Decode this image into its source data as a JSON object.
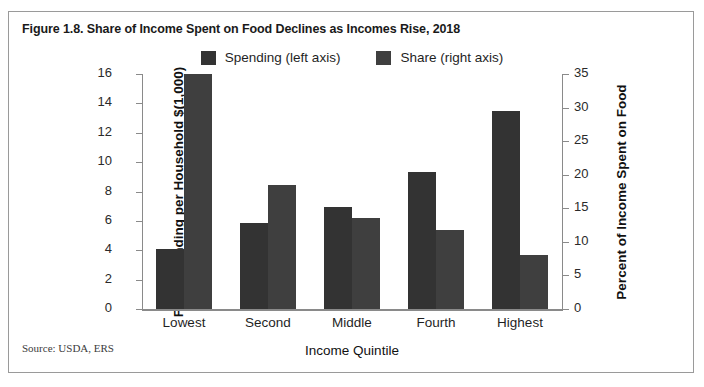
{
  "figure": {
    "title": "Figure 1.8. Share of Income Spent on Food Declines as Incomes Rise, 2018",
    "source": "Source: USDA, ERS"
  },
  "colors": {
    "spending_bar": "#333333",
    "share_bar": "#3f3f3f",
    "axis": "#8a8a8a",
    "text": "#1f1f1f",
    "card_border": "#9a9a9a"
  },
  "chart_data": {
    "type": "bar",
    "title": "Figure 1.8. Share of Income Spent on Food Declines as Incomes Rise, 2018",
    "xlabel": "Income Quintile",
    "ylabel": "Food Spending per Household $(1,000)",
    "ylabel_secondary": "Percent of Income Spent on Food",
    "categories": [
      "Lowest",
      "Second",
      "Middle",
      "Fourth",
      "Highest"
    ],
    "series": [
      {
        "name": "Spending (left axis)",
        "axis": "left",
        "values": [
          4.1,
          5.85,
          6.95,
          9.35,
          13.5
        ]
      },
      {
        "name": "Share (right axis)",
        "axis": "right",
        "values": [
          35.0,
          18.5,
          13.5,
          11.7,
          8.1
        ]
      }
    ],
    "ylim": [
      0,
      16
    ],
    "yticks": [
      0,
      2,
      4,
      6,
      8,
      10,
      12,
      14,
      16
    ],
    "ylim_secondary": [
      0,
      35
    ],
    "yticks_secondary": [
      0,
      5,
      10,
      15,
      20,
      25,
      30,
      35
    ],
    "grid": false,
    "legend_position": "top-center"
  },
  "legend": {
    "entries": [
      {
        "label": "Spending (left axis)",
        "color": "#333333"
      },
      {
        "label": "Share (right axis)",
        "color": "#3f3f3f"
      }
    ]
  }
}
